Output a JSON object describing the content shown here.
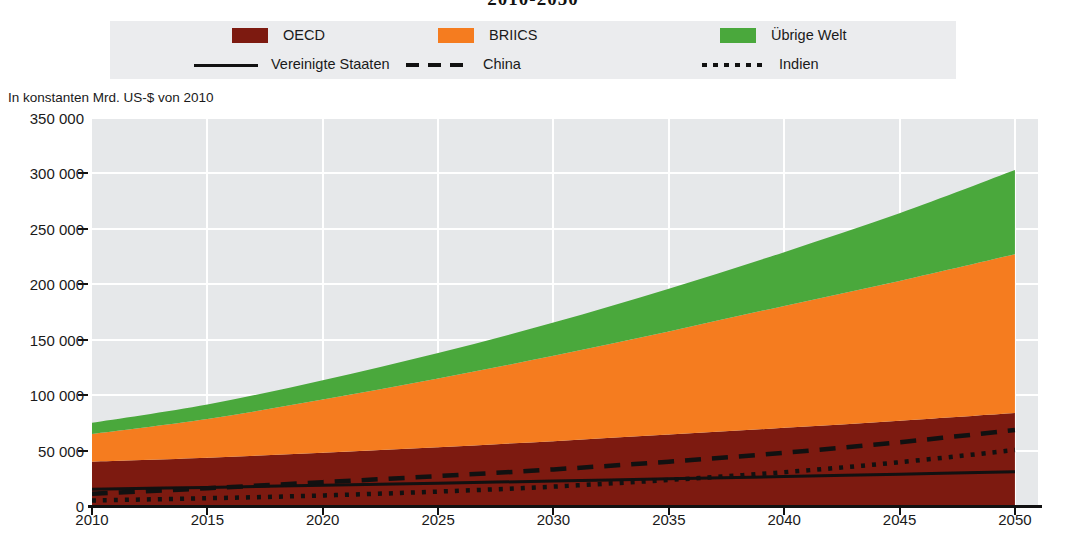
{
  "chart_title": "2010-2050",
  "unit_caption": "In konstanten Mrd. US-$ von 2010",
  "colors": {
    "oecd": "#7d1a10",
    "briics": "#f57c1f",
    "rest_of_world": "#4aa83c",
    "plot_background": "#e6e8ea",
    "gridline": "#ffffff",
    "line": "#111111",
    "legend_background": "#ebecee"
  },
  "legend": {
    "areas": [
      {
        "label": "OECD",
        "icon": "color-swatch",
        "color": "#7d1a10"
      },
      {
        "label": "BRIICS",
        "icon": "color-swatch",
        "color": "#f57c1f"
      },
      {
        "label": "Übrige Welt",
        "icon": "color-swatch",
        "color": "#4aa83c"
      }
    ],
    "lines": [
      {
        "label": "Vereinigte Staaten",
        "icon": "solid-line-swatch",
        "style": "solid"
      },
      {
        "label": "China",
        "icon": "dashed-line-swatch",
        "style": "dashed"
      },
      {
        "label": "Indien",
        "icon": "dotted-line-swatch",
        "style": "dotted"
      }
    ]
  },
  "chart_data": {
    "type": "area",
    "title": "2010-2050",
    "subtitle": "",
    "xlabel": "",
    "ylabel": "In konstanten Mrd. US-$ von 2010",
    "xlim": [
      2010,
      2051
    ],
    "ylim": [
      0,
      350000
    ],
    "grid": true,
    "stacked": true,
    "legend_position": "top",
    "x": [
      2010,
      2015,
      2020,
      2025,
      2030,
      2035,
      2040,
      2045,
      2050
    ],
    "xticks": [
      2010,
      2015,
      2020,
      2025,
      2030,
      2035,
      2040,
      2045,
      2050
    ],
    "xticklabels": [
      "2010",
      "2015",
      "2020",
      "2025",
      "2030",
      "2035",
      "2040",
      "2045",
      "2050"
    ],
    "yticks": [
      0,
      50000,
      100000,
      150000,
      200000,
      250000,
      300000,
      350000
    ],
    "yticklabels": [
      "0",
      "50 000",
      "100 000",
      "150 000",
      "200 000",
      "250 000",
      "300 000",
      "350 000"
    ],
    "series": [
      {
        "name": "OECD",
        "kind": "stacked-area",
        "color": "#7d1a10",
        "values": [
          40000,
          43500,
          48000,
          53000,
          58500,
          64500,
          70500,
          77000,
          84000
        ]
      },
      {
        "name": "BRIICS",
        "kind": "stacked-area",
        "color": "#f57c1f",
        "values": [
          25000,
          35000,
          48000,
          62000,
          77000,
          93000,
          110000,
          126000,
          143000
        ]
      },
      {
        "name": "Übrige Welt",
        "kind": "stacked-area",
        "color": "#4aa83c",
        "values": [
          10000,
          13000,
          17500,
          23000,
          30000,
          38500,
          48500,
          61000,
          76000
        ]
      },
      {
        "name": "Vereinigte Staaten",
        "kind": "line",
        "style": "solid",
        "color": "#111111",
        "values": [
          15000,
          16800,
          18700,
          20600,
          22500,
          24500,
          26500,
          28700,
          31000
        ]
      },
      {
        "name": "China",
        "kind": "line",
        "style": "dashed",
        "color": "#111111",
        "values": [
          11000,
          16000,
          21500,
          27000,
          33000,
          40000,
          48000,
          57500,
          68500
        ]
      },
      {
        "name": "Indien",
        "kind": "line",
        "style": "dotted",
        "color": "#111111",
        "values": [
          5000,
          7000,
          9500,
          13000,
          17500,
          23500,
          30500,
          39500,
          50500
        ]
      }
    ],
    "stack_totals_note": {
      "2010": 75000,
      "2050": 303000
    }
  }
}
